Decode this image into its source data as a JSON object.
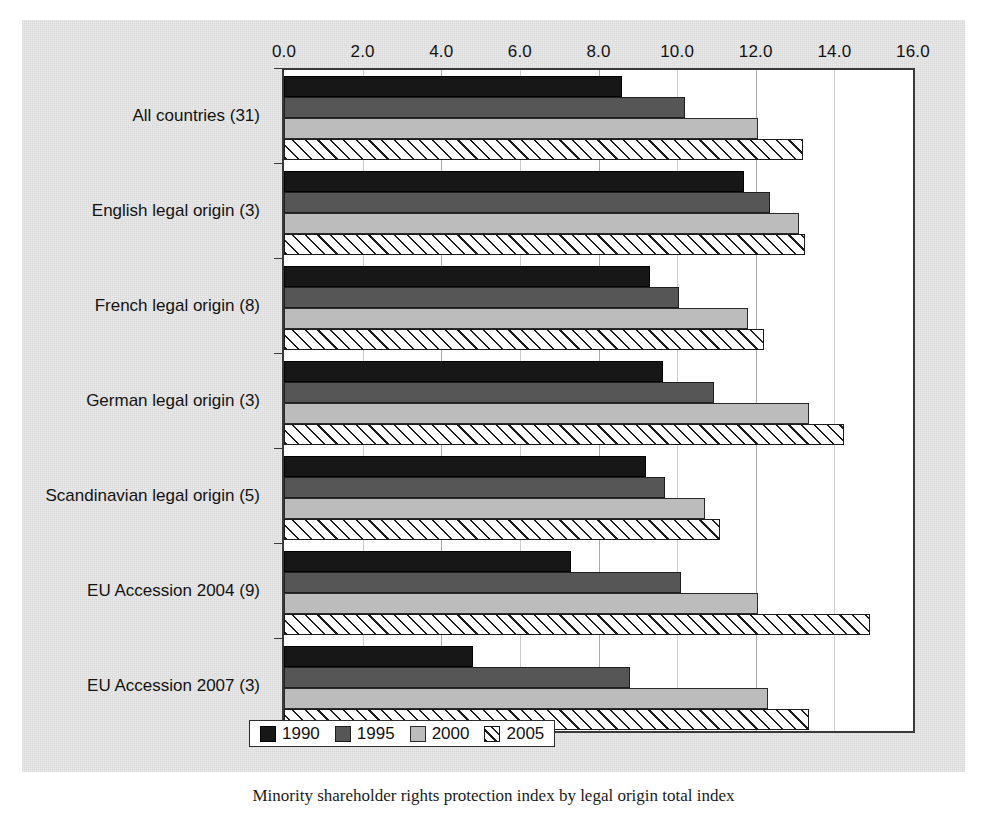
{
  "figure": {
    "caption": "Minority shareholder rights protection index by legal origin total index"
  },
  "chart_data": {
    "type": "bar",
    "orientation": "horizontal",
    "title": "",
    "xlabel": "",
    "ylabel": "",
    "xlim": [
      0.0,
      16.0
    ],
    "xticks": [
      "0.0",
      "2.0",
      "4.0",
      "6.0",
      "8.0",
      "10.0",
      "12.0",
      "14.0",
      "16.0"
    ],
    "xtick_values": [
      0,
      2,
      4,
      6,
      8,
      10,
      12,
      14,
      16
    ],
    "grid": true,
    "axis_position": "top",
    "legend_position": "bottom",
    "categories": [
      "All countries (31)",
      "English legal origin (3)",
      "French legal origin (8)",
      "German legal origin (3)",
      "Scandinavian legal origin (5)",
      "EU Accession 2004 (9)",
      "EU Accession 2007 (3)"
    ],
    "series": [
      {
        "name": "1990",
        "color": "#171717",
        "pattern": "solid",
        "values": [
          8.6,
          11.7,
          9.3,
          9.65,
          9.2,
          7.3,
          4.8
        ]
      },
      {
        "name": "1995",
        "color": "#565656",
        "pattern": "solid",
        "values": [
          10.2,
          12.35,
          10.05,
          10.95,
          9.7,
          10.1,
          8.8
        ]
      },
      {
        "name": "2000",
        "color": "#bcbcbc",
        "pattern": "solid",
        "values": [
          12.05,
          13.1,
          11.8,
          13.35,
          10.7,
          12.05,
          12.3
        ]
      },
      {
        "name": "2005",
        "color": "#ffffff",
        "pattern": "diagonal-hatch",
        "values": [
          13.2,
          13.25,
          12.2,
          14.25,
          11.1,
          14.9,
          13.35
        ]
      }
    ]
  }
}
